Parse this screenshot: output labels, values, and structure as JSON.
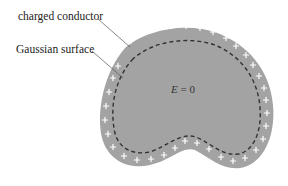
{
  "labels": {
    "charged_conductor": "charged conductor",
    "gaussian_surface": "Gaussian surface"
  },
  "interior": {
    "field_symbol": "E",
    "field_eq": " = 0"
  },
  "colors": {
    "conductor_fill": "#a3a3a3",
    "gaussian_dash": "#333333",
    "charge_sign": "#ffffff",
    "leader_line": "#555555",
    "text": "#222222"
  },
  "charge_sign": "+"
}
